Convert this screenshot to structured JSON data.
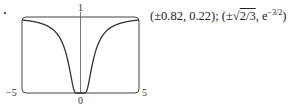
{
  "chart_data": {
    "type": "line",
    "title": "",
    "function": "f(x) = e^(-1/x^2)",
    "xlabel": "",
    "ylabel": "",
    "xlim": [
      -5,
      5
    ],
    "ylim": [
      0,
      1
    ],
    "grid": false,
    "legend": null,
    "tick_labels": {
      "x_left": "−5",
      "x_origin": "0",
      "x_right": "5",
      "y_top": "1"
    },
    "series": [
      {
        "name": "e^(-1/x^2)",
        "x": [
          -5,
          -4,
          -3,
          -2,
          -1.5,
          -1,
          -0.82,
          -0.6,
          -0.4,
          -0.3,
          -0.2,
          0,
          0.2,
          0.3,
          0.4,
          0.6,
          0.82,
          1,
          1.5,
          2,
          3,
          4,
          5
        ],
        "y": [
          0.961,
          0.939,
          0.895,
          0.779,
          0.641,
          0.368,
          0.223,
          0.062,
          0.002,
          0.0,
          0.0,
          0.0,
          0.0,
          0.0,
          0.002,
          0.062,
          0.223,
          0.368,
          0.641,
          0.779,
          0.895,
          0.939,
          0.961
        ]
      }
    ],
    "annotations": [
      {
        "text": "(±0.82, 0.22); (±√(2/3), e^(−3/2))",
        "meaning": "inflection points"
      }
    ]
  },
  "labels": {
    "x_min": "−5",
    "x_origin": "0",
    "x_max": "5",
    "y_top": "1"
  },
  "caption": {
    "approx": "(±0.82, 0.22); ",
    "exact_prefix": "(±",
    "radical": "2/3",
    "exact_mid": ", e",
    "exponent": "−3/2",
    "exact_suffix": ")"
  }
}
